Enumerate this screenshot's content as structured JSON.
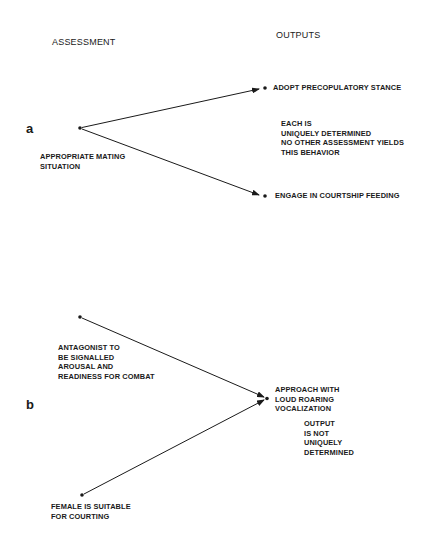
{
  "headers": {
    "assessment": "ASSESSMENT",
    "outputs": "OUTPUTS"
  },
  "panel_a": {
    "label": "a",
    "assessment": "APPROPRIATE MATING\nSITUATION",
    "outputs": [
      "ADOPT PRECOPULATORY STANCE",
      "ENGAGE IN COURTSHIP FEEDING"
    ],
    "note": "EACH IS\nUNIQUELY DETERMINED\nNO OTHER ASSESSMENT YIELDS\nTHIS BEHAVIOR"
  },
  "panel_b": {
    "label": "b",
    "assessments": [
      "ANTAGONIST TO\nBE SIGNALLED\nAROUSAL AND\nREADINESS FOR COMBAT",
      "FEMALE IS SUITABLE\nFOR COURTING"
    ],
    "output": "APPROACH WITH\nLOUD ROARING\nVOCALIZATION",
    "note": "OUTPUT\nIS NOT\nUNIQUELY\nDETERMINED"
  },
  "colors": {
    "ink": "#1a1a1a",
    "background": "#ffffff"
  }
}
